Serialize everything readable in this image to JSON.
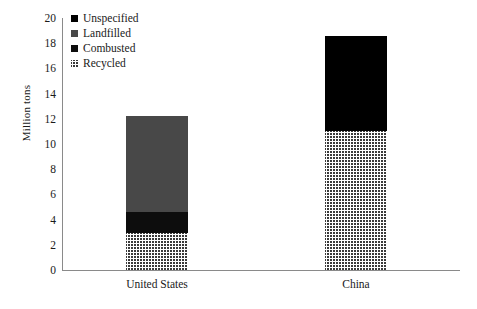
{
  "chart_data": {
    "type": "bar",
    "subtype": "stacked",
    "title": "",
    "xlabel": "",
    "ylabel": "Million tons",
    "ylim": [
      0,
      20
    ],
    "ytick_step": 2,
    "yticks": [
      20,
      18,
      16,
      14,
      12,
      10,
      8,
      6,
      4,
      2,
      0
    ],
    "grid": false,
    "legend_position": "top-left",
    "categories": [
      "United States",
      "China"
    ],
    "series": [
      {
        "name": "Unspecified",
        "values": [
          0,
          7.6
        ],
        "fill": "solid-black",
        "color": "#000000"
      },
      {
        "name": "Landfilled",
        "values": [
          7.6,
          0
        ],
        "fill": "solid-gray",
        "color": "#484848"
      },
      {
        "name": "Combusted",
        "values": [
          1.7,
          0
        ],
        "fill": "solid-dark",
        "color": "#0d0d0d"
      },
      {
        "name": "Recycled",
        "values": [
          2.9,
          11.0
        ],
        "fill": "crosshatch",
        "color": "#3a3a3a"
      }
    ],
    "totals": [
      12.2,
      18.6
    ],
    "stack_order_bottom_to_top": [
      "Recycled",
      "Combusted",
      "Landfilled",
      "Unspecified"
    ]
  },
  "legend": {
    "items": [
      {
        "label": "Unspecified",
        "swatch": "legend-swatch-unspecified"
      },
      {
        "label": "Landfilled",
        "swatch": "legend-swatch-landfilled"
      },
      {
        "label": "Combusted",
        "swatch": "legend-swatch-combusted"
      },
      {
        "label": "Recycled",
        "swatch": "legend-swatch-recycled"
      }
    ]
  },
  "axes": {
    "y_label": "Million tons",
    "y_ticks": [
      "20",
      "18",
      "16",
      "14",
      "12",
      "10",
      "8",
      "6",
      "4",
      "2",
      "0"
    ],
    "x_ticks": [
      "United States",
      "China"
    ]
  },
  "colors": {
    "axis": "#8a8a8a",
    "text": "#1a1a1a",
    "background": "#ffffff",
    "unspecified": "#000000",
    "landfilled": "#484848",
    "combusted": "#0d0d0d",
    "recycled": "#3a3a3a"
  }
}
